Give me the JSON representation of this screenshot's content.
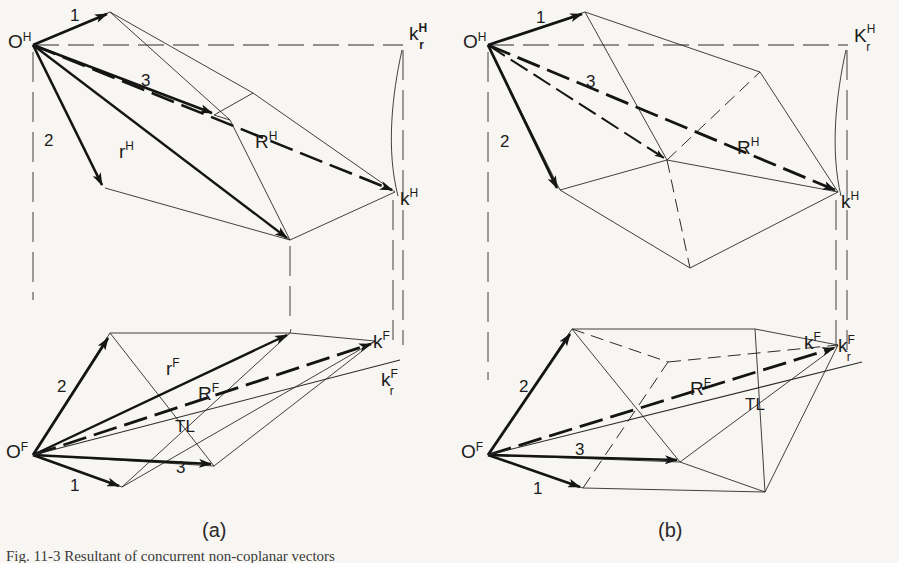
{
  "figure": {
    "title": "Fig. 11-3   Resultant of concurrent non-coplanar vectors",
    "background_color": "#f8f6f2",
    "ink_color": "#1c1c1c",
    "panels": [
      {
        "id": "a",
        "caption": "(a)"
      },
      {
        "id": "b",
        "caption": "(b)"
      }
    ]
  },
  "panel_a": {
    "caption": "(a)",
    "top_view": {
      "origin_label": {
        "base": "O",
        "sup": "H"
      },
      "vectors": [
        {
          "name": "1",
          "label": "1"
        },
        {
          "name": "2",
          "label": "2"
        },
        {
          "name": "3",
          "label": "3"
        }
      ],
      "resultant_label": {
        "base": "R",
        "sup": "H"
      },
      "partial_resultant_label": {
        "base": "r",
        "sup": "H"
      },
      "terminus_label": {
        "base": "k",
        "sup": "H"
      },
      "revolved_terminus_label": {
        "base": "k",
        "sub": "r",
        "sup": "H"
      }
    },
    "front_view": {
      "origin_label": {
        "base": "O",
        "sup": "F"
      },
      "vectors": [
        {
          "name": "1",
          "label": "1"
        },
        {
          "name": "2",
          "label": "2"
        },
        {
          "name": "3",
          "label": "3"
        }
      ],
      "resultant_label": {
        "base": "R",
        "sup": "F"
      },
      "partial_resultant_label": {
        "base": "r",
        "sup": "F"
      },
      "true_length_label": "TL",
      "terminus_label": {
        "base": "k",
        "sup": "F"
      },
      "revolved_terminus_label": {
        "base": "k",
        "sub": "r",
        "sup": "F"
      }
    }
  },
  "panel_b": {
    "caption": "(b)",
    "top_view": {
      "origin_label": {
        "base": "O",
        "sup": "H"
      },
      "vectors": [
        {
          "name": "1",
          "label": "1"
        },
        {
          "name": "2",
          "label": "2"
        },
        {
          "name": "3",
          "label": "3"
        }
      ],
      "resultant_label": {
        "base": "R",
        "sup": "H"
      },
      "terminus_label": {
        "base": "k",
        "sup": "H"
      },
      "revolved_terminus_label": {
        "base": "k",
        "sub": "r",
        "sup": "H"
      }
    },
    "front_view": {
      "origin_label": {
        "base": "O",
        "sup": "F"
      },
      "vectors": [
        {
          "name": "1",
          "label": "1"
        },
        {
          "name": "2",
          "label": "2"
        },
        {
          "name": "3",
          "label": "3"
        }
      ],
      "resultant_label": {
        "base": "R",
        "sup": "F"
      },
      "true_length_label": "TL",
      "terminus_label": {
        "base": "k",
        "sup": "F"
      },
      "revolved_terminus_label": {
        "base": "k",
        "sub": "r",
        "sup": "F"
      }
    }
  }
}
